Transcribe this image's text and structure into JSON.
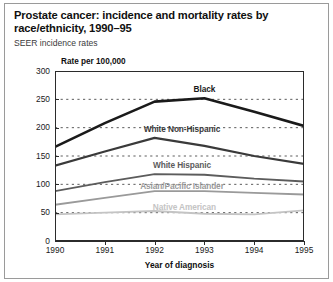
{
  "figure": {
    "title": "Prostate cancer: incidence and mortality rates by race/ethnicity, 1990–95",
    "subtitle": "SEER incidence rates",
    "axis_unit_label": "Rate per 100,000",
    "xlabel": "Year of diagnosis"
  },
  "chart_data": {
    "type": "line",
    "title": "Prostate cancer: incidence and mortality rates by race/ethnicity, 1990–95",
    "subtitle": "SEER incidence rates",
    "xlabel": "Year of diagnosis",
    "ylabel": "Rate per 100,000",
    "x": [
      1990,
      1991,
      1992,
      1993,
      1994,
      1995
    ],
    "xlim": [
      1990,
      1995
    ],
    "ylim": [
      0,
      300
    ],
    "yticks": [
      0,
      50,
      100,
      150,
      200,
      250,
      300
    ],
    "xticks": [
      "1990",
      "1991",
      "1992",
      "1993",
      "1994",
      "1995"
    ],
    "grid": "horizontal-dotted",
    "legend": "inline-series-labels",
    "series": [
      {
        "name": "Black",
        "color": "#1a1a1a",
        "width": 2.6,
        "values": [
          166,
          208,
          246,
          252,
          228,
          203
        ],
        "label_x": 1993.0,
        "label_y": 268
      },
      {
        "name": "White Non-Hispanic",
        "color": "#3a3a3a",
        "width": 2.2,
        "values": [
          133,
          158,
          182,
          168,
          150,
          136
        ],
        "label_x": 1992.55,
        "label_y": 196
      },
      {
        "name": "White Hispanic",
        "color": "#5c5c5c",
        "width": 1.9,
        "values": [
          88,
          104,
          118,
          117,
          110,
          105
        ],
        "label_x": 1992.55,
        "label_y": 134
      },
      {
        "name": "Asian/Pacific Islander",
        "color": "#9a9a9a",
        "width": 1.9,
        "values": [
          64,
          76,
          88,
          88,
          85,
          82
        ],
        "label_x": 1992.55,
        "label_y": 96
      },
      {
        "name": "Native American",
        "color": "#c4c4c4",
        "width": 1.9,
        "values": [
          47,
          50,
          53,
          48,
          47,
          54
        ],
        "label_x": 1992.6,
        "label_y": 60
      }
    ]
  }
}
